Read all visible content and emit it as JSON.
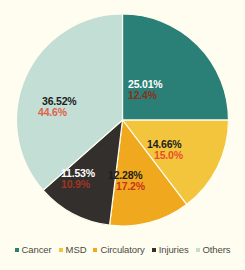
{
  "chart_data": {
    "type": "pie",
    "title": "",
    "categories": [
      "Cancer",
      "MSD",
      "Circulatory",
      "Injuries",
      "Others"
    ],
    "values": [
      25.01,
      14.66,
      12.28,
      11.53,
      36.52
    ],
    "series": [
      {
        "name": "primary",
        "values": [
          25.01,
          14.66,
          12.28,
          11.53,
          36.52
        ],
        "labels": [
          "25.01%",
          "14.66%",
          "12.28%",
          "11.53%",
          "36.52%"
        ]
      },
      {
        "name": "secondary",
        "values": [
          12.4,
          15.0,
          17.2,
          10.9,
          44.6
        ],
        "labels": [
          "12.4%",
          "15.0%",
          "17.2%",
          "10.9%",
          "44.6%"
        ]
      }
    ],
    "colors": [
      "#2a8076",
      "#f2c53d",
      "#f0a91e",
      "#332f2c",
      "#c2ded5"
    ],
    "legend_position": "bottom",
    "start_angle": 0,
    "grid": false,
    "xlabel": "",
    "ylabel": ""
  },
  "slices": [
    {
      "name": "Cancer",
      "value": 25.01,
      "primary_label": "25.01%",
      "secondary_label": "12.4%",
      "color": "#2a8076",
      "primary_color": "#ffffff",
      "secondary_color": "#8d2f20"
    },
    {
      "name": "MSD",
      "value": 14.66,
      "primary_label": "14.66%",
      "secondary_label": "15.0%",
      "color": "#f2c53d",
      "primary_color": "#1d1d1b",
      "secondary_color": "#e8502a"
    },
    {
      "name": "Circulatory",
      "value": 12.28,
      "primary_label": "12.28%",
      "secondary_label": "17.2%",
      "color": "#f0a91e",
      "primary_color": "#1d1d1b",
      "secondary_color": "#c8341c"
    },
    {
      "name": "Injuries",
      "value": 11.53,
      "primary_label": "11.53%",
      "secondary_label": "10.9%",
      "color": "#332f2c",
      "primary_color": "#ffffff",
      "secondary_color": "#a03524"
    },
    {
      "name": "Others",
      "value": 36.52,
      "primary_label": "36.52%",
      "secondary_label": "44.6%",
      "color": "#c2ded5",
      "primary_color": "#1d1d1b",
      "secondary_color": "#e0624a"
    }
  ],
  "legend": {
    "items": [
      {
        "label": "Cancer",
        "color": "#2a8076"
      },
      {
        "label": "MSD",
        "color": "#f2c53d"
      },
      {
        "label": "Circulatory",
        "color": "#f0a91e"
      },
      {
        "label": "Injuries",
        "color": "#332f2c"
      },
      {
        "label": "Others",
        "color": "#c2ded5"
      }
    ]
  },
  "background_color": "#fffdf0"
}
